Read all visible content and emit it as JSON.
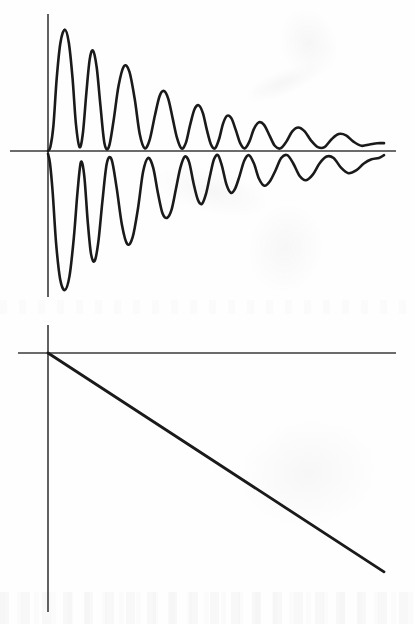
{
  "document": {
    "title": "Damped oscillation and linear decay figure",
    "background_color": "#fefefe",
    "ink_color": "#1a1a1a",
    "axis_color": "#3a3a3a",
    "width": 415,
    "height": 624
  },
  "chart_data": [
    {
      "id": "upper",
      "type": "line",
      "title": "",
      "subtitle": "",
      "xlabel": "",
      "ylabel": "",
      "grid": false,
      "legend_position": "none",
      "axes": {
        "origin_px": [
          48,
          151
        ],
        "x_axis_extent_px": [
          10,
          396
        ],
        "y_axis_extent_px": [
          14,
          297
        ],
        "x_axis_visible": true,
        "y_axis_visible": true
      },
      "xlim": [
        0,
        1
      ],
      "ylim": [
        -1.05,
        1.05
      ],
      "annotations": [],
      "series": [
        {
          "name": "upper-envelope-trace",
          "color": "#1a1a1a",
          "line_width": 2.6,
          "description": "Damped oscillation above the horizontal axis, starting at the origin, first peak largest, amplitude decaying to near zero at the right edge.",
          "x": [
            0.0,
            0.007,
            0.016,
            0.026,
            0.037,
            0.05,
            0.062,
            0.073,
            0.083,
            0.094,
            0.104,
            0.114,
            0.124,
            0.134,
            0.145,
            0.156,
            0.168,
            0.181,
            0.195,
            0.21,
            0.226,
            0.242,
            0.258,
            0.273,
            0.288,
            0.303,
            0.318,
            0.332,
            0.345,
            0.358,
            0.371,
            0.384,
            0.397,
            0.41,
            0.423,
            0.436,
            0.449,
            0.461,
            0.473,
            0.485,
            0.497,
            0.509,
            0.521,
            0.533,
            0.546,
            0.559,
            0.572,
            0.585,
            0.599,
            0.613,
            0.628,
            0.643,
            0.659,
            0.675,
            0.692,
            0.709,
            0.727,
            0.745,
            0.764,
            0.783,
            0.803,
            0.823,
            0.844,
            0.865,
            0.887,
            0.91,
            0.933,
            0.957,
            0.98,
            1.0
          ],
          "y": [
            0.0,
            0.03,
            0.19,
            0.56,
            0.83,
            0.93,
            0.83,
            0.56,
            0.21,
            0.03,
            0.14,
            0.44,
            0.7,
            0.77,
            0.64,
            0.35,
            0.06,
            0.03,
            0.23,
            0.5,
            0.65,
            0.61,
            0.4,
            0.13,
            0.02,
            0.09,
            0.27,
            0.42,
            0.46,
            0.4,
            0.25,
            0.1,
            0.02,
            0.06,
            0.2,
            0.32,
            0.35,
            0.29,
            0.16,
            0.05,
            0.02,
            0.09,
            0.21,
            0.27,
            0.25,
            0.16,
            0.06,
            0.02,
            0.07,
            0.17,
            0.22,
            0.2,
            0.12,
            0.04,
            0.02,
            0.07,
            0.15,
            0.18,
            0.15,
            0.08,
            0.03,
            0.03,
            0.09,
            0.13,
            0.12,
            0.07,
            0.04,
            0.05,
            0.06,
            0.06
          ]
        },
        {
          "name": "lower-envelope-trace",
          "color": "#1a1a1a",
          "line_width": 2.6,
          "description": "Mirror-image damped oscillation below the horizontal axis, phase-shifted, decaying toward the axis and rising slightly at the right edge.",
          "x": [
            0.0,
            0.006,
            0.014,
            0.024,
            0.036,
            0.05,
            0.064,
            0.077,
            0.088,
            0.098,
            0.108,
            0.118,
            0.128,
            0.139,
            0.15,
            0.162,
            0.175,
            0.189,
            0.204,
            0.22,
            0.236,
            0.252,
            0.268,
            0.283,
            0.298,
            0.313,
            0.327,
            0.341,
            0.355,
            0.368,
            0.381,
            0.394,
            0.407,
            0.42,
            0.433,
            0.446,
            0.458,
            0.47,
            0.482,
            0.494,
            0.506,
            0.518,
            0.531,
            0.544,
            0.557,
            0.57,
            0.584,
            0.598,
            0.613,
            0.628,
            0.644,
            0.66,
            0.677,
            0.694,
            0.712,
            0.73,
            0.749,
            0.768,
            0.788,
            0.808,
            0.829,
            0.85,
            0.872,
            0.894,
            0.917,
            0.94,
            0.963,
            0.985,
            1.0
          ],
          "y": [
            -0.02,
            -0.09,
            -0.3,
            -0.66,
            -0.92,
            -1.0,
            -0.9,
            -0.62,
            -0.29,
            -0.08,
            -0.18,
            -0.5,
            -0.74,
            -0.79,
            -0.65,
            -0.36,
            -0.09,
            -0.06,
            -0.26,
            -0.53,
            -0.67,
            -0.62,
            -0.41,
            -0.15,
            -0.05,
            -0.12,
            -0.3,
            -0.45,
            -0.48,
            -0.42,
            -0.27,
            -0.12,
            -0.04,
            -0.08,
            -0.23,
            -0.35,
            -0.38,
            -0.31,
            -0.18,
            -0.06,
            -0.03,
            -0.11,
            -0.24,
            -0.3,
            -0.27,
            -0.18,
            -0.07,
            -0.03,
            -0.09,
            -0.2,
            -0.25,
            -0.22,
            -0.14,
            -0.05,
            -0.03,
            -0.09,
            -0.18,
            -0.21,
            -0.17,
            -0.09,
            -0.04,
            -0.05,
            -0.12,
            -0.16,
            -0.14,
            -0.09,
            -0.06,
            -0.05,
            -0.03
          ]
        }
      ]
    },
    {
      "id": "lower",
      "type": "line",
      "title": "",
      "subtitle": "",
      "xlabel": "",
      "ylabel": "",
      "grid": false,
      "legend_position": "none",
      "axes": {
        "origin_px": [
          48,
          353
        ],
        "x_axis_extent_px": [
          18,
          396
        ],
        "y_axis_extent_px": [
          325,
          612
        ],
        "x_axis_visible": true,
        "y_axis_visible": true
      },
      "xlim": [
        0,
        1
      ],
      "ylim": [
        -1.0,
        0.08
      ],
      "annotations": [],
      "series": [
        {
          "name": "linear-decay-trace",
          "color": "#1a1a1a",
          "line_width": 2.8,
          "description": "Straight line descending from the origin at a constant negative slope to the lower right.",
          "x": [
            0.0,
            1.0
          ],
          "y": [
            0.0,
            -0.845
          ]
        }
      ]
    }
  ]
}
